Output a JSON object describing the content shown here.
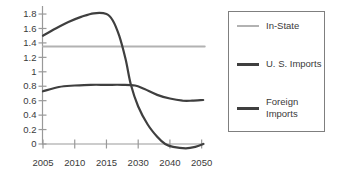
{
  "legend": {
    "items": [
      {
        "label": "In-State",
        "color": "#b2b2b2",
        "thickness": 2
      },
      {
        "label": "U. S. Imports",
        "color": "#3f3f3f",
        "thickness": 3
      },
      {
        "label": "Foreign\nImports",
        "color": "#3f3f3f",
        "thickness": 3
      }
    ]
  },
  "chart_data": {
    "type": "line",
    "title": "",
    "xlabel": "",
    "ylabel": "",
    "grid": false,
    "legend_position": "right-boxed",
    "ylim": [
      0,
      1.8
    ],
    "x_tick_labels": [
      "2005",
      "2010",
      "2015",
      "2030",
      "2040",
      "2050"
    ],
    "y_tick_labels": [
      "1.8",
      "1.6",
      "1.4",
      "1.2",
      "1",
      "0.8",
      "0.6",
      "0.4",
      "0.2",
      "0"
    ],
    "axis_note": "x ticks are evenly spaced although year intervals are uneven (5,5,15,10,10)",
    "colors": {
      "axis": "#999999",
      "tick_text": "#3a3a3a",
      "light_series": "#b2b2b2",
      "dark_series": "#3f3f3f"
    },
    "series": [
      {
        "name": "In-State",
        "color": "#b2b2b2",
        "width": 1.8,
        "points": [
          [
            0,
            1.35
          ],
          [
            5.1,
            1.35
          ]
        ]
      },
      {
        "name": "Foreign Imports",
        "color": "#3f3f3f",
        "width": 2.2,
        "points": [
          [
            0,
            0.73
          ],
          [
            0.5,
            0.79
          ],
          [
            1.0,
            0.81
          ],
          [
            1.5,
            0.82
          ],
          [
            2.0,
            0.82
          ],
          [
            2.5,
            0.82
          ],
          [
            2.9,
            0.81
          ],
          [
            3.2,
            0.76
          ],
          [
            3.6,
            0.68
          ],
          [
            4.0,
            0.63
          ],
          [
            4.4,
            0.6
          ],
          [
            4.7,
            0.6
          ],
          [
            5.05,
            0.61
          ]
        ]
      },
      {
        "name": "U. S. Imports",
        "color": "#3f3f3f",
        "width": 2.2,
        "points": [
          [
            0,
            1.5
          ],
          [
            0.4,
            1.6
          ],
          [
            0.8,
            1.69
          ],
          [
            1.2,
            1.76
          ],
          [
            1.6,
            1.81
          ],
          [
            2.0,
            1.8
          ],
          [
            2.2,
            1.71
          ],
          [
            2.4,
            1.5
          ],
          [
            2.6,
            1.18
          ],
          [
            2.77,
            0.82
          ],
          [
            3.0,
            0.52
          ],
          [
            3.3,
            0.27
          ],
          [
            3.6,
            0.1
          ],
          [
            3.85,
            0.0
          ],
          [
            4.1,
            -0.04
          ],
          [
            4.5,
            -0.06
          ],
          [
            4.8,
            -0.04
          ],
          [
            5.05,
            0.0
          ]
        ]
      }
    ]
  }
}
